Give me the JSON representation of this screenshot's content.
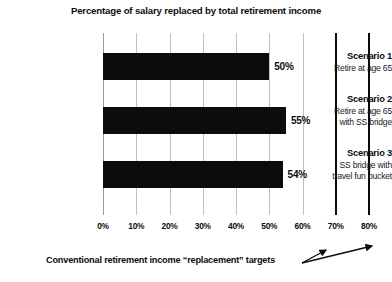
{
  "chart_data": {
    "type": "bar",
    "orientation": "horizontal",
    "title": "Percentage of salary replaced by total retirement income",
    "xlabel": "",
    "ylabel": "",
    "xlim": [
      0,
      80
    ],
    "grid": true,
    "legend": false,
    "categories": [
      "Scenario 1 Retire at age 65",
      "Scenario 2 Retire at age 65 with SS bridge",
      "Scenario 3 SS bridge with travel fun bucket"
    ],
    "values": [
      50,
      55,
      54
    ],
    "value_labels": [
      "50%",
      "55%",
      "54%"
    ],
    "rows": [
      {
        "name": "Scenario 1",
        "desc_line1": "Retire at age 65",
        "desc_line2": "",
        "value": 50,
        "value_label": "50%"
      },
      {
        "name": "Scenario 2",
        "desc_line1": "Retire at age 65",
        "desc_line2": "with SS bridge",
        "value": 55,
        "value_label": "55%"
      },
      {
        "name": "Scenario 3",
        "desc_line1": "SS bridge with",
        "desc_line2": "travel fun bucket",
        "value": 54,
        "value_label": "54%"
      }
    ],
    "x_ticks": [
      0,
      10,
      20,
      30,
      40,
      50,
      60,
      70,
      80
    ],
    "x_tick_labels": [
      "0%",
      "10%",
      "20%",
      "30%",
      "40%",
      "50%",
      "60%",
      "70%",
      "80%"
    ],
    "reference_lines": [
      {
        "value": 70,
        "label": "70%"
      },
      {
        "value": 80,
        "label": "80%"
      }
    ],
    "annotation": "Conventional retirement income “replacement” targets",
    "colors": {
      "bar": "#0c0c0c",
      "gridline": "#bfbfbf",
      "reference_line": "#0a0a0a",
      "text": "#0d0d0d",
      "background": "#ffffff"
    }
  }
}
